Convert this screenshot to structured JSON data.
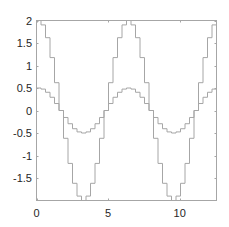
{
  "chart_data": {
    "type": "line",
    "subtype": "stairs",
    "title": "",
    "xlabel": "",
    "ylabel": "",
    "xlim": [
      0,
      12.566
    ],
    "ylim": [
      -2,
      2
    ],
    "grid": false,
    "legend": null,
    "x_ticks": [
      0,
      5,
      10
    ],
    "x_tick_labels": [
      "0",
      "5",
      "10"
    ],
    "y_ticks": [
      2,
      1.5,
      1,
      0.5,
      0,
      -0.5,
      -1,
      -1.5
    ],
    "y_tick_labels": [
      "2",
      "1.5",
      "1",
      "0.5",
      "0",
      "-0.5",
      "-1",
      "-1.5"
    ],
    "x": [
      0,
      0.3142,
      0.6283,
      0.9425,
      1.2566,
      1.5708,
      1.885,
      2.1991,
      2.5133,
      2.8274,
      3.1416,
      3.4558,
      3.7699,
      4.0841,
      4.3982,
      4.7124,
      5.0265,
      5.3407,
      5.6549,
      5.969,
      6.2832,
      6.5973,
      6.9115,
      7.2257,
      7.5398,
      7.854,
      8.1681,
      8.4823,
      8.7965,
      9.1106,
      9.4248,
      9.7389,
      10.0531,
      10.3673,
      10.6814,
      10.9956,
      11.3097,
      11.6239,
      11.9381,
      12.2522,
      12.5664
    ],
    "series": [
      {
        "name": "2cos(x)",
        "color": "#a6a6a6",
        "values": [
          2,
          1.902,
          1.618,
          1.176,
          0.618,
          0,
          -0.618,
          -1.176,
          -1.618,
          -1.902,
          -2,
          -1.902,
          -1.618,
          -1.176,
          -0.618,
          0,
          0.618,
          1.176,
          1.618,
          1.902,
          2,
          1.902,
          1.618,
          1.176,
          0.618,
          0,
          -0.618,
          -1.176,
          -1.618,
          -1.902,
          -2,
          -1.902,
          -1.618,
          -1.176,
          -0.618,
          0,
          0.618,
          1.176,
          1.618,
          1.902,
          2
        ]
      },
      {
        "name": "0.5cos(x)",
        "color": "#a6a6a6",
        "values": [
          0.5,
          0.476,
          0.405,
          0.294,
          0.155,
          0,
          -0.155,
          -0.294,
          -0.405,
          -0.476,
          -0.5,
          -0.476,
          -0.405,
          -0.294,
          -0.155,
          0,
          0.155,
          0.294,
          0.405,
          0.476,
          0.5,
          0.476,
          0.405,
          0.294,
          0.155,
          0,
          -0.155,
          -0.294,
          -0.405,
          -0.476,
          -0.5,
          -0.476,
          -0.405,
          -0.294,
          -0.155,
          0,
          0.155,
          0.294,
          0.405,
          0.476,
          0.5
        ]
      }
    ]
  },
  "style": {
    "axis_color": "#a6a6a6",
    "label_color": "#262626",
    "background": "#ffffff"
  }
}
